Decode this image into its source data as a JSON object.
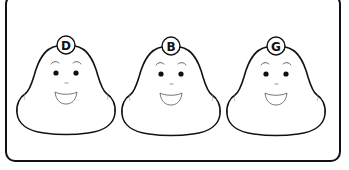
{
  "scene": {
    "description": "Three identical cartoon blob faces, each with a lettered badge on top",
    "frame_color": "#111111",
    "background": "#ffffff"
  },
  "characters": [
    {
      "label": "D",
      "center_x": 66
    },
    {
      "label": "B",
      "center_x": 171
    },
    {
      "label": "G",
      "center_x": 276
    }
  ]
}
